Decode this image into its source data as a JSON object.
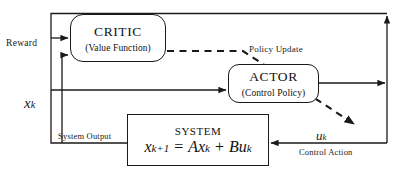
{
  "diagram": {
    "type": "actor-critic reinforcement learning block diagram",
    "blocks": {
      "critic": {
        "title": "CRITIC",
        "subtitle": "(Value Function)"
      },
      "actor": {
        "title": "ACTOR",
        "subtitle": "(Control Policy)"
      },
      "system": {
        "title": "SYSTEM",
        "equation_lhs": "x",
        "equation_lhs_sub": "k+1",
        "equation_eq": " = ",
        "equation_a": "A",
        "equation_x": "x",
        "equation_x_sub": "k",
        "equation_plus": " + ",
        "equation_b": "B",
        "equation_u": "u",
        "equation_u_sub": "k",
        "equation_full": "x(k+1) = Ax(k) + Bu(k)"
      }
    },
    "labels": {
      "reward": "Reward",
      "policy_update": "Policy Update",
      "system_output": "System Output",
      "control_action": "Control Action",
      "state_symbol": "x",
      "state_sub": "k",
      "control_symbol": "u",
      "control_sub": "k"
    },
    "colors": {
      "line": "#1a1a1a",
      "text": "#111111",
      "background": "#ffffff"
    },
    "edges": [
      {
        "name": "top-feedback-into-critic",
        "style": "solid",
        "from": "right-bus-top",
        "to": "critic-left-upper"
      },
      {
        "name": "bottom-feedback-into-critic",
        "style": "solid",
        "from": "system-output-bus",
        "to": "critic-left-lower"
      },
      {
        "name": "state-into-actor",
        "style": "solid",
        "from": "system-output-bus",
        "to": "actor-left"
      },
      {
        "name": "policy-update-dashed",
        "style": "dashed",
        "from": "critic-right",
        "to": "right-bus-lower"
      },
      {
        "name": "control-action-into-system",
        "style": "solid",
        "from": "right-bus",
        "to": "system-right"
      },
      {
        "name": "system-output-to-right-bus",
        "style": "solid",
        "from": "system-left",
        "to": "right-bus-top"
      }
    ]
  }
}
